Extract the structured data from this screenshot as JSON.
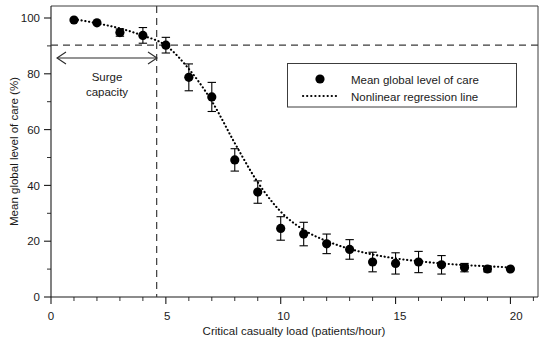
{
  "chart_data": {
    "type": "scatter",
    "title": "",
    "xlabel": "Critical casualty load (patients/hour)",
    "ylabel": "Mean global level of care (%)",
    "xlim": [
      0,
      21.2
    ],
    "ylim": [
      0,
      104
    ],
    "xticks": [
      0,
      5,
      10,
      15,
      20
    ],
    "xtick_labels": [
      "0",
      "5",
      "10",
      "15",
      "20"
    ],
    "xminor_step": 1,
    "yticks": [
      0,
      20,
      40,
      60,
      80,
      100
    ],
    "ytick_labels": [
      "0",
      "20",
      "40",
      "60",
      "80",
      "100"
    ],
    "yminor_step": 10,
    "grid": false,
    "legend_position": "upper-right",
    "x": [
      1,
      2,
      3,
      4,
      5,
      6,
      7,
      8,
      9,
      10,
      11,
      12,
      13,
      14,
      15,
      16,
      17,
      18,
      19,
      20
    ],
    "values": [
      99.0,
      98.0,
      94.5,
      93.5,
      90.0,
      78.5,
      71.5,
      49.0,
      37.5,
      24.5,
      22.5,
      19.0,
      17.0,
      12.5,
      12.0,
      12.5,
      11.5,
      10.5,
      10.0,
      10.0
    ],
    "error_upper": [
      0.6,
      0.8,
      1.3,
      2.8,
      2.8,
      4.8,
      5.2,
      4.0,
      4.0,
      4.2,
      4.2,
      3.5,
      3.5,
      3.5,
      3.8,
      3.8,
      3.3,
      1.5,
      1.0,
      0.7
    ],
    "error_lower": [
      0.6,
      0.8,
      1.3,
      2.8,
      2.8,
      4.8,
      5.2,
      4.0,
      4.0,
      4.2,
      4.2,
      3.5,
      3.5,
      3.5,
      3.8,
      3.8,
      3.3,
      1.5,
      1.0,
      0.7
    ],
    "series": [
      {
        "name": "Mean global level of care",
        "values": [
          99.0,
          98.0,
          94.5,
          93.5,
          90.0,
          78.5,
          71.5,
          49.0,
          37.5,
          24.5,
          22.5,
          19.0,
          17.0,
          12.5,
          12.0,
          12.5,
          11.5,
          10.5,
          10.0,
          10.0
        ]
      },
      {
        "name": "Nonlinear regression line",
        "values": [
          99.2,
          97.8,
          96.0,
          93.4,
          89.9,
          81.5,
          70.0,
          55.0,
          41.0,
          30.5,
          24.0,
          20.0,
          17.2,
          15.2,
          13.8,
          12.8,
          12.0,
          11.4,
          11.0,
          10.6
        ]
      }
    ],
    "annotations": [
      {
        "name": "surge-capacity",
        "text_line1": "Surge",
        "text_line2": "capacity",
        "arrow_x_start": 0.25,
        "arrow_x_end": 4.6
      },
      {
        "name": "threshold-horizontal",
        "value": 90,
        "style": "dashed"
      },
      {
        "name": "threshold-vertical",
        "value": 4.6,
        "style": "dashed"
      }
    ]
  },
  "legend": {
    "items": [
      {
        "label": "Mean global level of care",
        "marker": "filled-circle"
      },
      {
        "label": "Nonlinear regression line",
        "marker": "dotted-line"
      }
    ]
  },
  "axes": {
    "x_title": "Critical casualty load (patients/hour)",
    "y_title": "Mean global level of care (%)"
  }
}
